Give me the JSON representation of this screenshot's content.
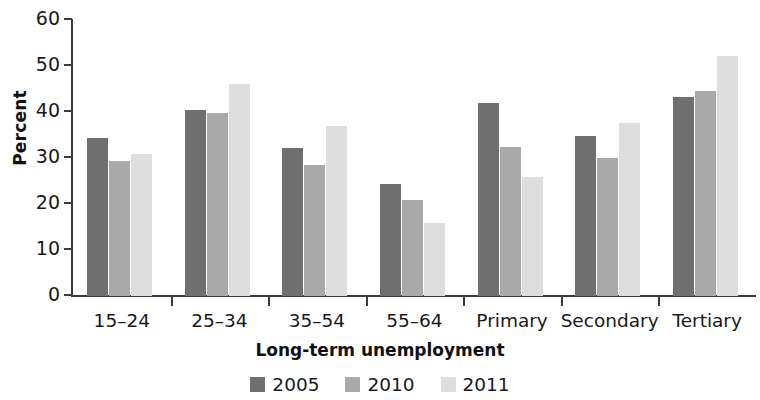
{
  "chart_data": {
    "type": "bar",
    "title": "",
    "subtitle": "",
    "xlabel": "Long-term unemployment",
    "ylabel": "Percent",
    "ylim": [
      0,
      60
    ],
    "yticks": [
      0,
      10,
      20,
      30,
      40,
      50,
      60
    ],
    "grid": false,
    "legend_position": "bottom",
    "categories": [
      "15–24",
      "25–34",
      "35–54",
      "55–64",
      "Primary",
      "Secondary",
      "Tertiary"
    ],
    "series": [
      {
        "name": "2005",
        "color": "#6f6f6f",
        "values": [
          34.3,
          40.5,
          32.1,
          24.3,
          42.0,
          34.8,
          43.2
        ]
      },
      {
        "name": "2010",
        "color": "#a9a9a9",
        "values": [
          29.3,
          39.7,
          28.4,
          20.8,
          32.4,
          29.9,
          44.6
        ]
      },
      {
        "name": "2011",
        "color": "#dedede",
        "values": [
          30.8,
          46.1,
          37.0,
          15.8,
          25.9,
          37.6,
          52.2
        ]
      }
    ]
  }
}
